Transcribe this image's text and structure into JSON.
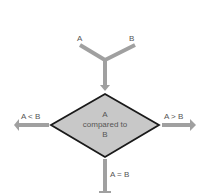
{
  "diagram": {
    "inputs": {
      "a_label": "A",
      "b_label": "B"
    },
    "decision": {
      "line1": "A",
      "line2": "compared to",
      "line3": "B",
      "fill": "#c8c8c8",
      "stroke": "#1a1a1a"
    },
    "branches": {
      "left_label": "A < B",
      "right_label": "A > B",
      "bottom_label": "A = B"
    },
    "arrow_color": "#a0a0a0"
  }
}
